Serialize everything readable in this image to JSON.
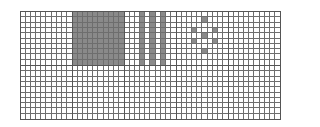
{
  "figure": {
    "block_rows": 2,
    "block_cols": 5,
    "cells_per_block": 10,
    "colors": {
      "line": "#6e6e6e",
      "border": "#555555",
      "fill": "#8a8a8a",
      "background": "#ffffff"
    },
    "blocks": [
      {
        "row": 0,
        "col": 0,
        "pattern": "empty"
      },
      {
        "row": 0,
        "col": 1,
        "pattern": "solid"
      },
      {
        "row": 0,
        "col": 2,
        "pattern": "stripes",
        "filled_columns": [
          3,
          5,
          7
        ]
      },
      {
        "row": 0,
        "col": 3,
        "pattern": "dots",
        "filled_cells": [
          [
            5,
            1
          ],
          [
            3,
            3
          ],
          [
            7,
            3
          ],
          [
            5,
            4
          ],
          [
            3,
            5
          ],
          [
            7,
            5
          ],
          [
            5,
            7
          ]
        ]
      },
      {
        "row": 0,
        "col": 4,
        "pattern": "empty"
      },
      {
        "row": 1,
        "col": 0,
        "pattern": "empty"
      },
      {
        "row": 1,
        "col": 1,
        "pattern": "empty"
      },
      {
        "row": 1,
        "col": 2,
        "pattern": "empty"
      },
      {
        "row": 1,
        "col": 3,
        "pattern": "empty"
      },
      {
        "row": 1,
        "col": 4,
        "pattern": "empty"
      }
    ]
  }
}
